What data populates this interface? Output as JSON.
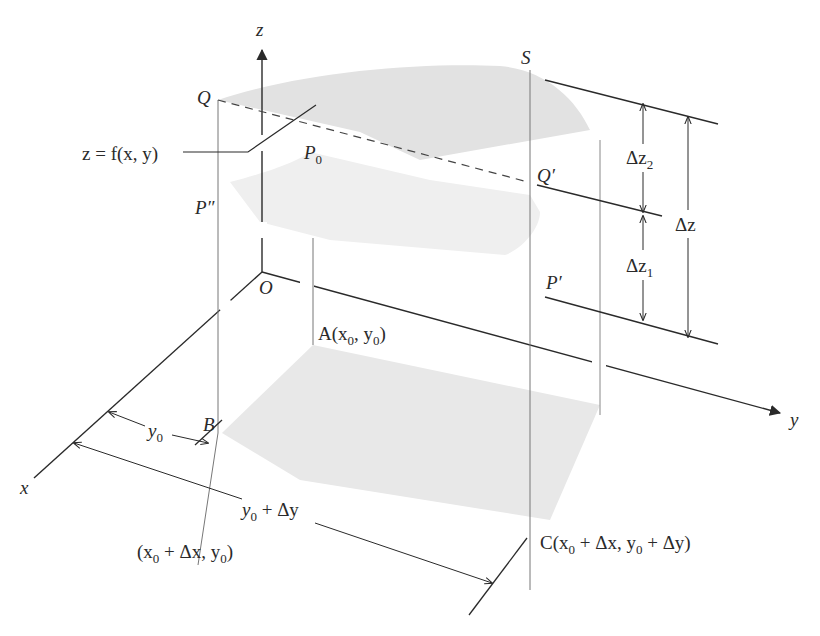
{
  "figure": {
    "axes": {
      "x": "x",
      "y": "y",
      "z": "z",
      "origin": "O"
    },
    "surface_label": "z = f(x, y)",
    "points": {
      "Q": "Q",
      "S": "S",
      "P0": "P",
      "P0_sub": "0",
      "P_double_prime": "P",
      "P_double_prime_mark": "″",
      "Q_prime": "Q",
      "Q_prime_mark": "′",
      "P_prime": "P",
      "P_prime_mark": "′",
      "B": "B",
      "A": {
        "name": "A(x",
        "sub0": "0",
        "mid": ", y",
        "sub1": "0",
        "end": ")"
      },
      "B_coords": {
        "a": "(x",
        "sub0": "0",
        "b": " + Δx, y",
        "sub1": "0",
        "c": ")"
      },
      "C": {
        "a": "C(x",
        "sub0": "0",
        "b": " + Δx, y",
        "sub1": "0",
        "c": " + Δy)"
      }
    },
    "dimensions": {
      "dz2": {
        "main": "Δz",
        "sub": "2"
      },
      "dz1": {
        "main": "Δz",
        "sub": "1"
      },
      "dz": "Δz",
      "y0": {
        "main": "y",
        "sub": "0"
      },
      "y0_dy": {
        "main": "y",
        "sub": "0",
        "rest": " + Δy"
      }
    },
    "colors": {
      "line": "#2a2a2a",
      "thin_line": "#666666",
      "surface": "#e6e6e6",
      "surface_dark": "#dcdcdc"
    }
  }
}
